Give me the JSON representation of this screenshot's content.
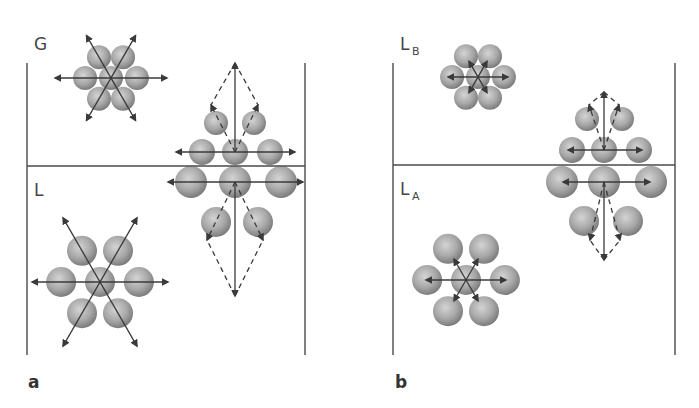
{
  "figure": {
    "width": 699,
    "height": 408,
    "colors": {
      "background": "#ffffff",
      "line": "#4a4a4a",
      "arrow": "#3a3a3a",
      "sphere_light": "#d4d4d4",
      "sphere_mid": "#a8a8a8",
      "sphere_dark": "#7c7c7c",
      "text": "#444444"
    }
  },
  "panels": [
    {
      "id": "a",
      "label": "a",
      "label_pos": [
        28,
        388
      ],
      "walls": {
        "left_x": 27,
        "right_x": 305,
        "top_y": 63,
        "bottom_y": 355
      },
      "interface_y": 166,
      "phases": [
        {
          "text": "G",
          "sub": "",
          "pos": [
            34,
            50
          ]
        },
        {
          "text": "L",
          "sub": "",
          "pos": [
            34,
            196
          ]
        }
      ],
      "clusters": [
        {
          "name": "gas-phase-molecule-cluster",
          "center": [
            111,
            78
          ],
          "ring": 24,
          "r": 12,
          "dir": "out",
          "diag": 49,
          "horiz": 56
        },
        {
          "name": "liquid-bulk-molecule-cluster",
          "center": [
            100,
            282
          ],
          "ring": 36,
          "r": 15,
          "dir": "out",
          "diag": 74,
          "horiz": 68
        }
      ],
      "interface_cluster": {
        "name": "surface-molecule-cluster",
        "cx": 235,
        "rows": [
          {
            "y": 123,
            "xs": [
              216,
              254
            ],
            "r": 12
          },
          {
            "y": 152,
            "xs": [
              202,
              235,
              270
            ],
            "r": 13
          },
          {
            "y": 182,
            "xs": [
              191,
              235,
              281
            ],
            "r": 16
          },
          {
            "y": 222,
            "xs": [
              216,
              258
            ],
            "r": 15
          }
        ],
        "row2_arrow": [
          176,
          295,
          152
        ],
        "row3_arrow": [
          168,
          303,
          182
        ],
        "vertical_up": [
          235,
          152,
          63
        ],
        "vertical_down": [
          235,
          182,
          296
        ],
        "dashed_up": [
          [
            211,
            105
          ],
          [
            258,
            105
          ]
        ],
        "dashed_down": [
          [
            207,
            240
          ],
          [
            263,
            240
          ]
        ]
      }
    },
    {
      "id": "b",
      "label": "b",
      "label_pos": [
        395,
        388
      ],
      "walls": {
        "left_x": 393,
        "right_x": 675,
        "top_y": 63,
        "bottom_y": 355
      },
      "interface_y": 165,
      "phases": [
        {
          "text": "L",
          "sub": "B",
          "pos": [
            400,
            50
          ]
        },
        {
          "text": "L",
          "sub": "A",
          "pos": [
            400,
            195
          ]
        }
      ],
      "clusters": [
        {
          "name": "liquid-b-molecule-cluster",
          "center": [
            478,
            77
          ],
          "ring": 24,
          "r": 12,
          "dir": "in",
          "diag": 18,
          "horiz": 30
        },
        {
          "name": "liquid-a-molecule-cluster",
          "center": [
            466,
            280
          ],
          "ring": 36,
          "r": 15,
          "dir": "in",
          "diag": 24,
          "horiz": 40
        }
      ],
      "interface_cluster": {
        "name": "interface-molecule-cluster",
        "cx": 604,
        "rows": [
          {
            "y": 119,
            "xs": [
              587,
              622
            ],
            "r": 12
          },
          {
            "y": 150,
            "xs": [
              572,
              604,
              639
            ],
            "r": 13
          },
          {
            "y": 182,
            "xs": [
              562,
              604,
              651
            ],
            "r": 16
          },
          {
            "y": 221,
            "xs": [
              584,
              628
            ],
            "r": 15
          }
        ],
        "row2_arrow": [
          568,
          642,
          150
        ],
        "row3_arrow": [
          563,
          650,
          182
        ],
        "vertical_up": [
          604,
          150,
          92
        ],
        "vertical_down": [
          604,
          182,
          260
        ],
        "dashed_up": [
          [
            589,
            105
          ],
          [
            619,
            105
          ]
        ],
        "dashed_down": [
          [
            590,
            240
          ],
          [
            620,
            240
          ]
        ]
      }
    }
  ]
}
